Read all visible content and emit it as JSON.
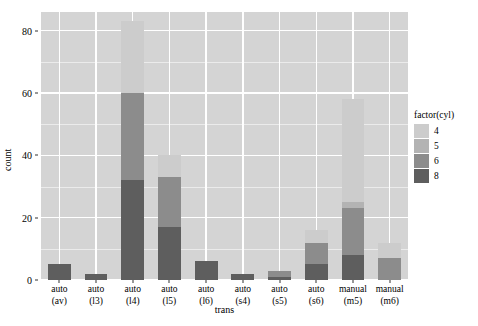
{
  "chart_data": {
    "type": "bar",
    "title": "",
    "subtitle": "",
    "xlabel": "trans",
    "ylabel": "count",
    "stacked": true,
    "grid": true,
    "legend_position": "right",
    "legend_title": "factor(cyl)",
    "ylim": [
      0,
      86
    ],
    "y_ticks": [
      0,
      20,
      40,
      60,
      80
    ],
    "y_minor_ticks": [
      10,
      30,
      50,
      70
    ],
    "categories": [
      "auto\n(av)",
      "auto\n(l3)",
      "auto\n(l4)",
      "auto\n(l5)",
      "auto\n(l6)",
      "auto\n(s4)",
      "auto\n(s5)",
      "auto\n(s6)",
      "manual\n(m5)",
      "manual\n(m6)"
    ],
    "category_lines": [
      [
        "auto",
        "(av)"
      ],
      [
        "auto",
        "(l3)"
      ],
      [
        "auto",
        "(l4)"
      ],
      [
        "auto",
        "(l5)"
      ],
      [
        "auto",
        "(l6)"
      ],
      [
        "auto",
        "(s4)"
      ],
      [
        "auto",
        "(s5)"
      ],
      [
        "auto",
        "(s6)"
      ],
      [
        "manual",
        "(m5)"
      ],
      [
        "manual",
        "(m6)"
      ]
    ],
    "series": [
      {
        "name": "4",
        "color": "#cccccc",
        "values": [
          0,
          0,
          23,
          7,
          0,
          0,
          0,
          4,
          33,
          5
        ]
      },
      {
        "name": "5",
        "color": "#b3b3b3",
        "values": [
          0,
          0,
          0,
          0,
          0,
          0,
          0,
          0,
          2,
          0
        ]
      },
      {
        "name": "6",
        "color": "#8c8c8c",
        "values": [
          0,
          0,
          28,
          16,
          0,
          0,
          2,
          7,
          15,
          7
        ]
      },
      {
        "name": "8",
        "color": "#5e5e5e",
        "values": [
          5,
          2,
          32,
          17,
          6,
          2,
          1,
          5,
          8,
          0
        ]
      }
    ],
    "stack_order_bottom_to_top": [
      "8",
      "6",
      "5",
      "4"
    ],
    "totals": [
      5,
      2,
      83,
      40,
      6,
      2,
      3,
      16,
      58,
      12
    ]
  },
  "legend": {
    "title": "factor(cyl)",
    "entries": [
      {
        "label": "4",
        "color": "#cccccc"
      },
      {
        "label": "5",
        "color": "#b3b3b3"
      },
      {
        "label": "6",
        "color": "#8c8c8c"
      },
      {
        "label": "8",
        "color": "#5e5e5e"
      }
    ]
  },
  "axes": {
    "y_title": "count",
    "x_title": "trans",
    "y_tick_labels": [
      "0",
      "20",
      "40",
      "60",
      "80"
    ]
  },
  "colors": {
    "panel_background": "#d4d4d4",
    "grid_major": "#ffffff",
    "grid_minor": "#ebebeb",
    "page_background": "#ffffff",
    "text": "#000000"
  }
}
